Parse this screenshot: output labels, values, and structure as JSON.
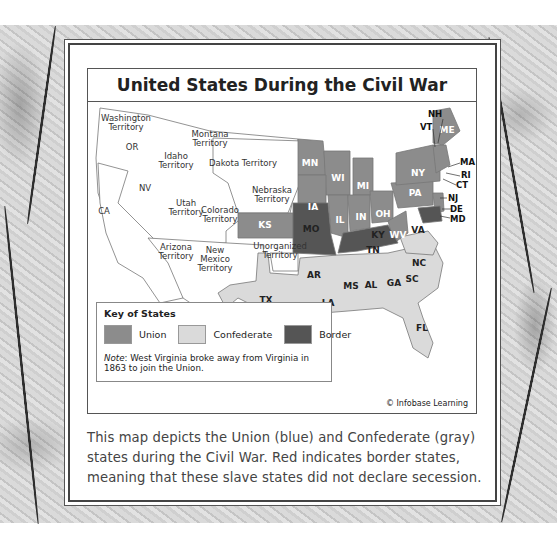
{
  "map": {
    "title": "United States During the Civil War",
    "colors": {
      "union": "#8c8c8c",
      "confederate": "#dadada",
      "border": "#555555",
      "territory": "#ffffff"
    },
    "territories": [
      {
        "name": "Washington",
        "line2": "Territory"
      },
      {
        "name": "Montana",
        "line2": "Territory"
      },
      {
        "name": "Idaho",
        "line2": "Territory"
      },
      {
        "name": "Dakota Territory",
        "line2": ""
      },
      {
        "name": "Nebraska",
        "line2": "Territory"
      },
      {
        "name": "Utah",
        "line2": "Territory"
      },
      {
        "name": "Colorado",
        "line2": "Territory"
      },
      {
        "name": "Arizona",
        "line2": "Territory"
      },
      {
        "name": "New",
        "line2": "Mexico",
        "line3": "Territory"
      },
      {
        "name": "Unorganized",
        "line2": "Territory"
      }
    ],
    "free_western_states": [
      "OR",
      "CA",
      "NV"
    ],
    "union_states": [
      "MN",
      "WI",
      "MI",
      "IA",
      "IL",
      "IN",
      "OH",
      "PA",
      "NY",
      "WV",
      "KS",
      "ME",
      "NH",
      "VT",
      "MA",
      "RI",
      "CT",
      "NJ"
    ],
    "border_states": [
      "MO",
      "KY",
      "DE",
      "MD"
    ],
    "confederate_states": [
      "VA",
      "NC",
      "TN",
      "SC",
      "AR",
      "MS",
      "AL",
      "GA",
      "TX",
      "LA",
      "FL"
    ],
    "callouts": [
      "NH",
      "VT",
      "MA",
      "RI",
      "CT",
      "NJ",
      "DE",
      "MD"
    ]
  },
  "key": {
    "title": "Key of States",
    "items": [
      {
        "label": "Union",
        "color": "#8c8c8c"
      },
      {
        "label": "Confederate",
        "color": "#dadada"
      },
      {
        "label": "Border",
        "color": "#555555"
      }
    ],
    "note_prefix": "Note",
    "note_text": ": West Virginia broke away from Virginia in 1863 to join the Union."
  },
  "credit": "© Infobase Learning",
  "caption": "This map depicts the Union (blue) and Confederate (gray) states during the Civil War. Red indicates border states, meaning that these slave states did not declare secession."
}
